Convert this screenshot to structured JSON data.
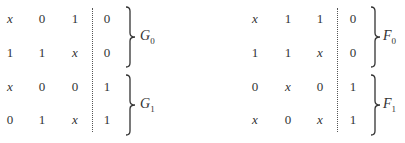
{
  "tables": [
    {
      "rows": [
        [
          "x",
          "0",
          "1",
          "0"
        ],
        [
          "1",
          "1",
          "x",
          "0"
        ],
        [
          "x",
          "0",
          "0",
          "1"
        ],
        [
          "0",
          "1",
          "x",
          "1"
        ]
      ],
      "groups": [
        {
          "label": "G",
          "sub": "0"
        },
        {
          "label": "G",
          "sub": "1"
        }
      ]
    },
    {
      "rows": [
        [
          "x",
          "1",
          "1",
          "0"
        ],
        [
          "1",
          "1",
          "x",
          "0"
        ],
        [
          "0",
          "x",
          "0",
          "1"
        ],
        [
          "x",
          "0",
          "x",
          "1"
        ]
      ],
      "groups": [
        {
          "label": "F",
          "sub": "0"
        },
        {
          "label": "F",
          "sub": "1"
        }
      ]
    }
  ]
}
